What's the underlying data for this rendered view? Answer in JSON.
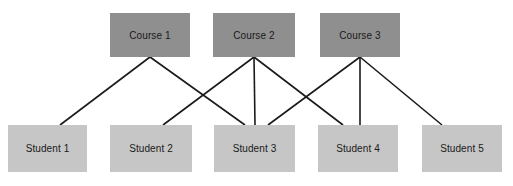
{
  "diagram": {
    "type": "bipartite-graph",
    "title": "",
    "canvas": {
      "width": 513,
      "height": 186,
      "background": "#ffffff"
    },
    "style": {
      "course_fill": "#8f8f8f",
      "student_fill": "#c6c6c6",
      "edge_color": "#1a1a1a",
      "edge_width": 1.6,
      "label_color": "#1a1a1a"
    },
    "courses": [
      {
        "id": "course1",
        "label": "Course 1",
        "x": 110,
        "y": 13,
        "w": 80,
        "h": 44
      },
      {
        "id": "course2",
        "label": "Course 2",
        "x": 213,
        "y": 13,
        "w": 82,
        "h": 44
      },
      {
        "id": "course3",
        "label": "Course 3",
        "x": 320,
        "y": 13,
        "w": 80,
        "h": 44
      }
    ],
    "students": [
      {
        "id": "student1",
        "label": "Student 1",
        "x": 8,
        "y": 125,
        "w": 79,
        "h": 47
      },
      {
        "id": "student2",
        "label": "Student 2",
        "x": 110,
        "y": 125,
        "w": 82,
        "h": 47
      },
      {
        "id": "student3",
        "label": "Student 3",
        "x": 214,
        "y": 125,
        "w": 81,
        "h": 47
      },
      {
        "id": "student4",
        "label": "Student 4",
        "x": 318,
        "y": 125,
        "w": 80,
        "h": 47
      },
      {
        "id": "student5",
        "label": "Student 5",
        "x": 422,
        "y": 125,
        "w": 80,
        "h": 47
      }
    ],
    "edges": [
      {
        "from": "course1",
        "to": "student1",
        "x1": 150,
        "y1": 57,
        "x2": 60,
        "y2": 125
      },
      {
        "from": "course1",
        "to": "student3",
        "x1": 150,
        "y1": 57,
        "x2": 245,
        "y2": 125
      },
      {
        "from": "course2",
        "to": "student2",
        "x1": 254,
        "y1": 57,
        "x2": 163,
        "y2": 125
      },
      {
        "from": "course2",
        "to": "student3",
        "x1": 254,
        "y1": 57,
        "x2": 255,
        "y2": 125
      },
      {
        "from": "course2",
        "to": "student4",
        "x1": 254,
        "y1": 57,
        "x2": 343,
        "y2": 125
      },
      {
        "from": "course3",
        "to": "student3",
        "x1": 360,
        "y1": 57,
        "x2": 268,
        "y2": 125
      },
      {
        "from": "course3",
        "to": "student4",
        "x1": 360,
        "y1": 57,
        "x2": 360,
        "y2": 125
      },
      {
        "from": "course3",
        "to": "student5",
        "x1": 360,
        "y1": 57,
        "x2": 442,
        "y2": 125
      }
    ]
  }
}
